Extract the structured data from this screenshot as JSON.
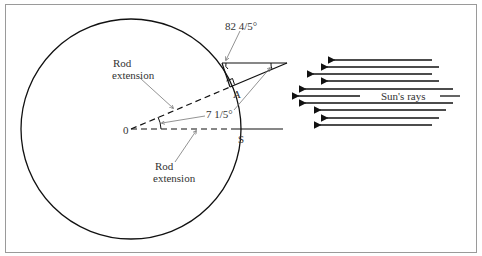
{
  "figure": {
    "labels": {
      "angle_top": "82 4/5°",
      "rod_extension_upper": [
        "Rod",
        "extension"
      ],
      "rod_extension_lower": [
        "Rod",
        "extension"
      ],
      "angle_center": "7 1/5°",
      "point_center": "0",
      "point_a": "A",
      "point_s": "S",
      "sun_rays": "Sun's rays"
    },
    "circle": {
      "cx": 131,
      "cy": 129,
      "r": 110
    },
    "colors": {
      "line": "#111111",
      "leader": "#777777",
      "frame": "#9a9a9a"
    },
    "sun_rays_count": 10
  }
}
